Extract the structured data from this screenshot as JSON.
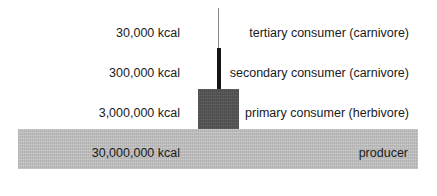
{
  "diagram": {
    "type": "energy-pyramid",
    "levels": [
      {
        "name": "tertiary consumer (carnivore)",
        "energy": "30,000 kcal"
      },
      {
        "name": "secondary consumer (carnivore)",
        "energy": "300,000 kcal"
      },
      {
        "name": "primary consumer (herbivore)",
        "energy": "3,000,000 kcal"
      },
      {
        "name": "producer",
        "energy": "30,000,000 kcal"
      }
    ],
    "colors": {
      "tertiary": "#8a8a8a",
      "secondary": "#151515",
      "primary": "#555555",
      "producer": "#bdbdbd"
    }
  }
}
